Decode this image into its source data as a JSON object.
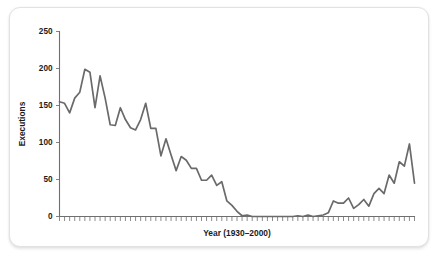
{
  "chart_data": {
    "type": "line",
    "title": "",
    "xlabel": "Year (1930–2000)",
    "ylabel": "Executions",
    "xlim": [
      1930,
      2000
    ],
    "ylim": [
      0,
      250
    ],
    "yticks": [
      0,
      50,
      100,
      150,
      200,
      250
    ],
    "ytick_labels": [
      "0",
      "50",
      "100",
      "150",
      "200",
      "250"
    ],
    "grid": false,
    "legend": false,
    "line_color": "#6a6a6a",
    "axis_color": "#6f6f6f",
    "x": [
      1930,
      1931,
      1932,
      1933,
      1934,
      1935,
      1936,
      1937,
      1938,
      1939,
      1940,
      1941,
      1942,
      1943,
      1944,
      1945,
      1946,
      1947,
      1948,
      1949,
      1950,
      1951,
      1952,
      1953,
      1954,
      1955,
      1956,
      1957,
      1958,
      1959,
      1960,
      1961,
      1962,
      1963,
      1964,
      1965,
      1966,
      1967,
      1968,
      1969,
      1970,
      1971,
      1972,
      1973,
      1974,
      1975,
      1976,
      1977,
      1978,
      1979,
      1980,
      1981,
      1982,
      1983,
      1984,
      1985,
      1986,
      1987,
      1988,
      1989,
      1990,
      1991,
      1992,
      1993,
      1994,
      1995,
      1996,
      1997,
      1998,
      1999,
      2000
    ],
    "series": [
      {
        "name": "Executions",
        "values": [
          155,
          153,
          140,
          160,
          168,
          199,
          195,
          147,
          190,
          160,
          124,
          123,
          147,
          131,
          120,
          117,
          131,
          153,
          119,
          119,
          82,
          105,
          83,
          62,
          81,
          76,
          65,
          65,
          49,
          49,
          56,
          42,
          47,
          21,
          15,
          7,
          1,
          2,
          0,
          0,
          0,
          0,
          0,
          0,
          0,
          0,
          0,
          1,
          0,
          2,
          0,
          1,
          2,
          5,
          21,
          18,
          18,
          25,
          11,
          16,
          23,
          14,
          31,
          38,
          31,
          56,
          45,
          74,
          68,
          98,
          45
        ]
      }
    ]
  },
  "axis": {
    "y_label": "Executions",
    "x_label": "Year (1930–2000)",
    "y_tick_labels": [
      "0",
      "50",
      "100",
      "150",
      "200",
      "250"
    ]
  }
}
